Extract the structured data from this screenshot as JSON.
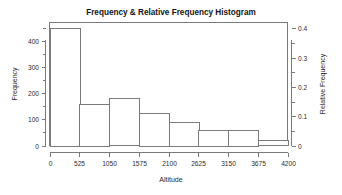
{
  "chart_data": {
    "type": "bar",
    "title": "Frequency & Relative Frequency Histogram",
    "xlabel": "Altitude",
    "ylabel": "Frequency",
    "y2label": "Relative Frequency",
    "categories": [
      "0-525",
      "525-1050",
      "1050-1575",
      "1575-2100",
      "2100-2625",
      "2625-3150",
      "3150-3675",
      "3675-4200"
    ],
    "bin_edges": [
      0,
      525,
      1050,
      1575,
      2100,
      2625,
      3150,
      3675,
      4200
    ],
    "values": [
      450,
      160,
      180,
      125,
      90,
      60,
      60,
      20
    ],
    "relative_values": [
      0.402,
      0.143,
      0.161,
      0.112,
      0.08,
      0.054,
      0.054,
      0.018
    ],
    "xlim": [
      0,
      4200
    ],
    "ylim": [
      0,
      470
    ],
    "y2lim": [
      0,
      0.42
    ],
    "x_ticks": [
      0,
      525,
      1050,
      1575,
      2100,
      2625,
      3150,
      3675,
      4200
    ],
    "x_tick_labels": [
      "0",
      "525",
      "1050",
      "1575",
      "2100",
      "2625",
      "3150",
      "3675",
      "4200"
    ],
    "y_ticks": [
      0,
      100,
      200,
      300,
      400
    ],
    "y_tick_labels": [
      "0",
      "100",
      "200",
      "300",
      "400"
    ],
    "y_minor_ticks": [
      50,
      150,
      250,
      350,
      450
    ],
    "y2_ticks": [
      0,
      0.1,
      0.2,
      0.3,
      0.4
    ],
    "y2_tick_labels": [
      "0",
      "0.1",
      "0.2",
      "0.3",
      "0.4"
    ],
    "y2_minor_ticks": [
      0.05,
      0.15,
      0.25,
      0.35
    ],
    "grid": false,
    "legend": null,
    "colors": {
      "bar_fill": "#ffffff",
      "bar_stroke": "#7a7a7a",
      "axis": "#7a7a7a",
      "text": "#1a1a1a",
      "background": "#ffffff"
    }
  }
}
